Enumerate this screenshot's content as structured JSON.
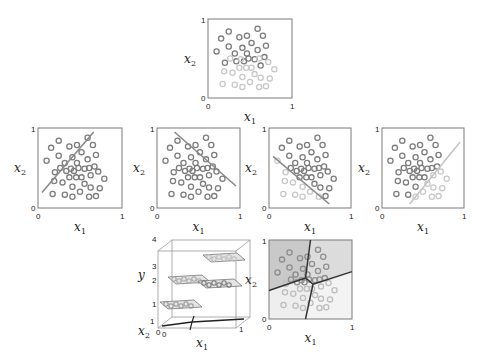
{
  "colors": {
    "frame": "#7a7a7a",
    "dark_point": "#7d7d7d",
    "light_point": "#c8c8c8",
    "mid_point": "#a5a5a5",
    "line": "#8a8a8a",
    "light_line": "#c4c4c4",
    "region_dark": "#c9c9c9",
    "region_mid": "#dcdcdc",
    "region_light": "#eeeeee",
    "boundary": "#333333"
  },
  "axes": {
    "x_label": "x",
    "x_sub": "1",
    "y_label": "x",
    "y_sub": "2",
    "tick_min": "0",
    "tick_max": "1"
  },
  "points": [
    {
      "x": 0.22,
      "y": 0.88,
      "c": "d"
    },
    {
      "x": 0.6,
      "y": 0.92,
      "c": "d"
    },
    {
      "x": 0.67,
      "y": 0.82,
      "c": "d"
    },
    {
      "x": 0.12,
      "y": 0.78,
      "c": "d"
    },
    {
      "x": 0.36,
      "y": 0.8,
      "c": "d"
    },
    {
      "x": 0.46,
      "y": 0.82,
      "c": "d"
    },
    {
      "x": 0.22,
      "y": 0.67,
      "c": "d"
    },
    {
      "x": 0.4,
      "y": 0.65,
      "c": "d"
    },
    {
      "x": 0.52,
      "y": 0.72,
      "c": "d"
    },
    {
      "x": 0.71,
      "y": 0.68,
      "c": "d"
    },
    {
      "x": 0.06,
      "y": 0.6,
      "c": "d"
    },
    {
      "x": 0.3,
      "y": 0.57,
      "c": "d"
    },
    {
      "x": 0.46,
      "y": 0.57,
      "c": "d"
    },
    {
      "x": 0.6,
      "y": 0.62,
      "c": "d"
    },
    {
      "x": 0.69,
      "y": 0.52,
      "c": "d"
    },
    {
      "x": 0.17,
      "y": 0.44,
      "c": "d"
    },
    {
      "x": 0.32,
      "y": 0.46,
      "c": "d"
    },
    {
      "x": 0.42,
      "y": 0.46,
      "c": "d"
    },
    {
      "x": 0.48,
      "y": 0.5,
      "c": "d"
    },
    {
      "x": 0.56,
      "y": 0.49,
      "c": "d"
    },
    {
      "x": 0.64,
      "y": 0.4,
      "c": "d"
    },
    {
      "x": 0.24,
      "y": 0.5,
      "c": "l"
    },
    {
      "x": 0.38,
      "y": 0.49,
      "c": "l"
    },
    {
      "x": 0.62,
      "y": 0.5,
      "c": "l"
    },
    {
      "x": 0.74,
      "y": 0.45,
      "c": "l"
    },
    {
      "x": 0.16,
      "y": 0.32,
      "c": "l"
    },
    {
      "x": 0.27,
      "y": 0.3,
      "c": "l"
    },
    {
      "x": 0.36,
      "y": 0.37,
      "c": "l"
    },
    {
      "x": 0.45,
      "y": 0.37,
      "c": "l"
    },
    {
      "x": 0.52,
      "y": 0.37,
      "c": "l"
    },
    {
      "x": 0.82,
      "y": 0.35,
      "c": "l"
    },
    {
      "x": 0.4,
      "y": 0.24,
      "c": "l"
    },
    {
      "x": 0.56,
      "y": 0.28,
      "c": "l"
    },
    {
      "x": 0.64,
      "y": 0.23,
      "c": "l"
    },
    {
      "x": 0.76,
      "y": 0.22,
      "c": "l"
    },
    {
      "x": 0.14,
      "y": 0.14,
      "c": "l"
    },
    {
      "x": 0.3,
      "y": 0.13,
      "c": "l"
    },
    {
      "x": 0.4,
      "y": 0.1,
      "c": "l"
    },
    {
      "x": 0.5,
      "y": 0.17,
      "c": "l"
    },
    {
      "x": 0.62,
      "y": 0.1,
      "c": "l"
    },
    {
      "x": 0.71,
      "y": 0.11,
      "c": "l"
    }
  ],
  "panels": {
    "top": {
      "x": 208,
      "y": 19,
      "w": 84,
      "h": 79,
      "mode": "shade"
    },
    "middle": [
      {
        "x": 38,
        "y": 128,
        "w": 84,
        "h": 80,
        "line": [
          [
            0,
            0.16
          ],
          [
            0.68,
            1
          ]
        ],
        "mode": "mono",
        "line_color": "line"
      },
      {
        "x": 157,
        "y": 128,
        "w": 83,
        "h": 80,
        "line": [
          [
            0.18,
            1
          ],
          [
            1,
            0.25
          ]
        ],
        "mode": "mono",
        "line_color": "line"
      },
      {
        "x": 269,
        "y": 128,
        "w": 82,
        "h": 80,
        "line": [
          [
            0,
            0.66
          ],
          [
            0.76,
            0
          ]
        ],
        "mode": "below",
        "line_color": "line"
      },
      {
        "x": 382,
        "y": 128,
        "w": 82,
        "h": 80,
        "line": [
          [
            0.32,
            0
          ],
          [
            1,
            0.86
          ]
        ],
        "mode": "right",
        "line_color": "light_line"
      }
    ],
    "voronoi": {
      "x": 269,
      "y": 240,
      "w": 83,
      "h": 79,
      "center": [
        0.44,
        0.52
      ],
      "junction_b": [
        0.53,
        0.44
      ],
      "edges": [
        [
          [
            0.44,
            0.52
          ],
          [
            0.5,
            1.0
          ]
        ],
        [
          [
            0.44,
            0.52
          ],
          [
            0.0,
            0.36
          ]
        ],
        [
          [
            0.44,
            0.52
          ],
          [
            0.53,
            0.44
          ]
        ],
        [
          [
            0.53,
            0.44
          ],
          [
            1.0,
            0.6
          ]
        ],
        [
          [
            0.53,
            0.44
          ],
          [
            0.44,
            0.0
          ]
        ]
      ]
    },
    "cube": {
      "y_ticks": [
        "1",
        "2",
        "3",
        "4"
      ],
      "x2_ticks": [
        "1",
        "0"
      ],
      "x1_ticks": [
        "0",
        "1"
      ],
      "y_label": "y",
      "x1_label": "x",
      "x1_sub": "1",
      "x2_label": "x",
      "x2_sub": "2"
    }
  }
}
